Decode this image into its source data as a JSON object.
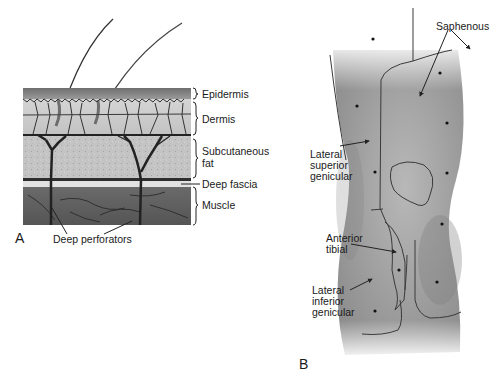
{
  "panels": [
    {
      "letter": "A",
      "title": "Skin cross-section",
      "layer_labels": [
        "Epidermis",
        "Dermis",
        "Subcutaneous",
        "fat",
        "Deep fascia",
        "Muscle"
      ],
      "callout": "Deep perforators"
    },
    {
      "letter": "B",
      "title": "Knee cutaneous nerve territories",
      "territory_labels": {
        "saphenous": "Saphenous",
        "lat_sup_1": "Lateral",
        "lat_sup_2": "superior",
        "lat_sup_3": "genicular",
        "ant_tib_1": "Anterior",
        "ant_tib_2": "tibial",
        "lat_inf_1": "Lateral",
        "lat_inf_2": "inferior",
        "lat_inf_3": "genicular"
      }
    }
  ],
  "colors": {
    "epidermis": "#7a7a7a",
    "dermis": "#c8c8c8",
    "fat": "#bdbdbd",
    "fascia": "#e6e6e6",
    "muscle": "#5e5e5e",
    "vessel": "#2a2a2a",
    "skin_shade": "#9a9a9a",
    "line": "#333333"
  }
}
